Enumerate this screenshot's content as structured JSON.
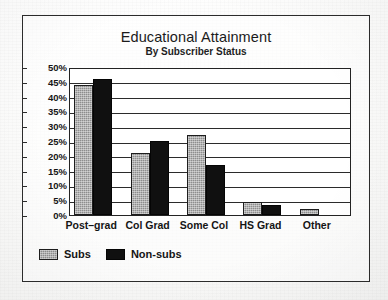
{
  "chart_data": {
    "type": "bar",
    "title": "Educational Attainment",
    "subtitle": "By Subscriber Status",
    "xlabel": "",
    "ylabel": "",
    "ylim": [
      0,
      50
    ],
    "ytick_step": 5,
    "ytick_labels": [
      "50%",
      "45%",
      "40%",
      "35%",
      "30%",
      "25%",
      "20%",
      "15%",
      "10%",
      "5%",
      "0%"
    ],
    "grid": true,
    "grid_axis": "y",
    "legend_position": "below-left",
    "value_unit": "percent",
    "categories": [
      "Post–grad",
      "Col Grad",
      "Some Col",
      "HS Grad",
      "Other"
    ],
    "series": [
      {
        "name": "Subs",
        "color": "#8d8d8d",
        "fill": "gray-stipple",
        "values": [
          44,
          21,
          27,
          4.5,
          2
        ]
      },
      {
        "name": "Non-subs",
        "color": "#101010",
        "fill": "solid-black",
        "values": [
          46,
          25,
          17,
          3.5,
          0
        ]
      }
    ],
    "annotations": []
  },
  "figure": {
    "frame_color": "#2c2c2c",
    "plot_background": "#ffffff",
    "page_background": "#fdfdfd"
  },
  "legend": {
    "entries": [
      {
        "label": "Subs",
        "swatch": "gray-stipple-swatch"
      },
      {
        "label": "Non-subs",
        "swatch": "solid-black-swatch"
      }
    ]
  }
}
